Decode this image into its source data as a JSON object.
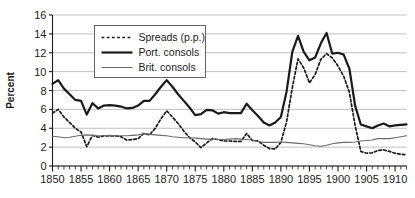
{
  "chart_data": {
    "type": "line",
    "title": "",
    "xlabel": "",
    "ylabel": "Percent",
    "xlim": [
      1850,
      1912
    ],
    "ylim": [
      0,
      16
    ],
    "ytick_step": 2,
    "xtick_step": 5,
    "minor_xtick_step": 1,
    "grid": true,
    "grid_axis": "y",
    "grid_color": "#b0b0b0",
    "legend_position": "upper-left-inside",
    "yticks": [
      "0",
      "2",
      "4",
      "6",
      "8",
      "10",
      "12",
      "14",
      "16"
    ],
    "xticks": [
      "1850",
      "1855",
      "1860",
      "1865",
      "1870",
      "1875",
      "1880",
      "1885",
      "1890",
      "1895",
      "1900",
      "1905",
      "1910"
    ],
    "x": [
      1850,
      1851,
      1852,
      1853,
      1854,
      1855,
      1856,
      1857,
      1858,
      1859,
      1860,
      1861,
      1862,
      1863,
      1864,
      1865,
      1866,
      1867,
      1868,
      1869,
      1870,
      1871,
      1872,
      1873,
      1874,
      1875,
      1876,
      1877,
      1878,
      1879,
      1880,
      1881,
      1882,
      1883,
      1884,
      1885,
      1886,
      1887,
      1888,
      1889,
      1890,
      1891,
      1892,
      1893,
      1894,
      1895,
      1896,
      1897,
      1898,
      1899,
      1900,
      1901,
      1902,
      1903,
      1904,
      1905,
      1906,
      1907,
      1908,
      1909,
      1910,
      1911,
      1912
    ],
    "series": [
      {
        "name": "Spreads (p.p.)",
        "style": "dashed",
        "color": "#1a1a1a",
        "width": 1.7,
        "values": [
          5.6,
          6.0,
          5.2,
          4.6,
          4.0,
          3.6,
          2.05,
          3.25,
          3.05,
          3.2,
          3.2,
          3.2,
          3.1,
          2.75,
          2.8,
          2.9,
          3.45,
          3.3,
          4.0,
          5.0,
          5.85,
          5.2,
          4.5,
          3.7,
          3.0,
          2.55,
          1.95,
          2.45,
          2.9,
          2.8,
          2.65,
          2.65,
          2.6,
          2.6,
          3.45,
          2.7,
          2.65,
          2.2,
          1.85,
          1.8,
          2.5,
          4.7,
          8.3,
          11.35,
          10.4,
          8.8,
          9.7,
          11.3,
          11.9,
          11.45,
          10.6,
          9.5,
          7.8,
          4.3,
          1.55,
          1.35,
          1.4,
          1.65,
          1.7,
          1.55,
          1.35,
          1.25,
          1.2
        ]
      },
      {
        "name": "Port. consols",
        "style": "solid",
        "color": "#1a1a1a",
        "width": 2.2,
        "values": [
          8.7,
          9.1,
          8.2,
          7.6,
          7.0,
          6.9,
          5.45,
          6.65,
          6.1,
          6.4,
          6.45,
          6.4,
          6.3,
          6.1,
          6.15,
          6.4,
          6.9,
          6.9,
          7.6,
          8.4,
          9.1,
          8.4,
          7.6,
          6.9,
          6.2,
          5.4,
          5.5,
          5.95,
          5.9,
          5.55,
          5.7,
          5.6,
          5.6,
          5.6,
          6.6,
          5.9,
          5.3,
          4.6,
          4.3,
          4.6,
          5.2,
          7.9,
          12.1,
          13.8,
          12.1,
          11.2,
          11.5,
          13.0,
          14.1,
          11.9,
          12.0,
          11.8,
          10.3,
          6.4,
          4.4,
          4.2,
          4.0,
          4.3,
          4.5,
          4.2,
          4.3,
          4.35,
          4.4
        ]
      },
      {
        "name": "Brit. consols",
        "style": "solid-thin",
        "color": "#6b6b6b",
        "width": 1.1,
        "values": [
          3.15,
          3.1,
          3.0,
          3.05,
          3.15,
          3.25,
          3.3,
          3.25,
          3.2,
          3.2,
          3.25,
          3.2,
          3.2,
          3.2,
          3.25,
          3.3,
          3.4,
          3.35,
          3.3,
          3.25,
          3.2,
          3.1,
          3.05,
          3.0,
          3.0,
          2.95,
          2.9,
          2.85,
          2.85,
          2.8,
          2.8,
          2.85,
          2.9,
          2.85,
          2.8,
          2.75,
          2.6,
          2.5,
          2.5,
          2.5,
          2.55,
          2.5,
          2.45,
          2.4,
          2.35,
          2.25,
          2.15,
          2.1,
          2.2,
          2.35,
          2.45,
          2.5,
          2.5,
          2.55,
          2.65,
          2.7,
          2.75,
          2.9,
          2.9,
          2.9,
          3.0,
          3.1,
          3.2
        ]
      }
    ]
  },
  "axis": {
    "ylabel": "Percent"
  },
  "legend": {
    "items": [
      {
        "label": "Spreads (p.p.)"
      },
      {
        "label": "Port. consols"
      },
      {
        "label": "Brit. consols"
      }
    ]
  }
}
